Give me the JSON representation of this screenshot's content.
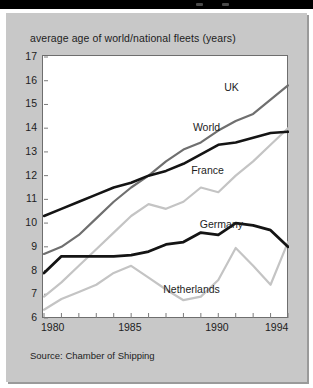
{
  "window": {
    "topbar_dots": [
      "dot-left",
      "dot-right"
    ]
  },
  "card": {
    "title": "average age of world/national fleets (years)",
    "source": "Source: Chamber of Shipping"
  },
  "axes": {
    "y_ticks": [
      "17",
      "16",
      "15",
      "14",
      "13",
      "12",
      "11",
      "10",
      "9",
      "8",
      "7",
      "6"
    ],
    "x_ticks": [
      "1980",
      "1985",
      "1990",
      "1994"
    ]
  },
  "series_labels": {
    "uk": "UK",
    "world": "World",
    "france": "France",
    "germany": "Germany",
    "netherlands": "Netherlands"
  },
  "chart_data": {
    "type": "line",
    "title": "average age of world/national fleets (years)",
    "subtitle": "",
    "xlabel": "",
    "ylabel": "average age (years)",
    "source": "Source: Chamber of Shipping",
    "x": [
      1980,
      1981,
      1982,
      1983,
      1984,
      1985,
      1986,
      1987,
      1988,
      1989,
      1990,
      1991,
      1992,
      1993,
      1994
    ],
    "xlim": [
      1980,
      1994
    ],
    "ylim": [
      6,
      17
    ],
    "y_ticks": [
      6,
      7,
      8,
      9,
      10,
      11,
      12,
      13,
      14,
      15,
      16,
      17
    ],
    "x_tick_labels": [
      1980,
      1985,
      1990,
      1994
    ],
    "grid": false,
    "legend": "inline-labels",
    "series": [
      {
        "name": "UK",
        "color": "#6f6f6f",
        "width": 2.2,
        "label_x": 1991.1,
        "label_y": 15.7,
        "values": [
          8.7,
          9.0,
          9.5,
          10.2,
          10.9,
          11.5,
          12.0,
          12.6,
          13.1,
          13.4,
          13.9,
          14.3,
          14.6,
          15.2,
          15.8
        ]
      },
      {
        "name": "World",
        "color": "#141414",
        "width": 2.6,
        "label_x": 1989.9,
        "label_y": 14.0,
        "values": [
          10.3,
          10.6,
          10.9,
          11.2,
          11.5,
          11.7,
          12.0,
          12.2,
          12.5,
          12.9,
          13.3,
          13.4,
          13.6,
          13.8,
          13.85
        ]
      },
      {
        "name": "France",
        "color": "#c4c4c4",
        "width": 2.2,
        "label_x": 1989.7,
        "label_y": 12.2,
        "values": [
          6.9,
          7.5,
          8.2,
          8.9,
          9.6,
          10.3,
          10.8,
          10.6,
          10.9,
          11.5,
          11.3,
          12.0,
          12.6,
          13.3,
          14.0
        ]
      },
      {
        "name": "Germany",
        "color": "#141414",
        "width": 2.8,
        "label_x": 1990.0,
        "label_y": 9.9,
        "values": [
          7.9,
          8.6,
          8.6,
          8.6,
          8.6,
          8.65,
          8.8,
          9.1,
          9.2,
          9.6,
          9.5,
          10.0,
          9.9,
          9.7,
          9.0
        ]
      },
      {
        "name": "Netherlands",
        "color": "#c4c4c4",
        "width": 2.2,
        "label_x": 1988.6,
        "label_y": 7.2,
        "values": [
          6.35,
          6.8,
          7.1,
          7.4,
          7.9,
          8.2,
          7.7,
          7.2,
          6.75,
          6.9,
          7.6,
          8.95,
          8.2,
          7.4,
          9.2
        ]
      }
    ]
  }
}
